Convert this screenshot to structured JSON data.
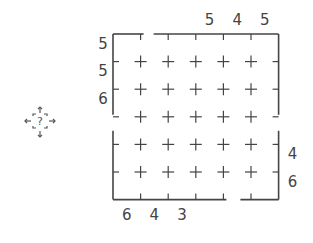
{
  "puzzle": {
    "grid": {
      "rows": 6,
      "cols": 6,
      "cell_size": 27.6,
      "origin_x": 113,
      "origin_y": 34,
      "line_color": "#444444"
    },
    "clues": {
      "top": [
        "",
        "",
        "",
        "5",
        "4",
        "5"
      ],
      "left": [
        "5",
        "5",
        "6",
        "",
        "",
        ""
      ],
      "right": [
        "",
        "",
        "",
        "",
        "4",
        "6"
      ],
      "bottom": [
        "6",
        "4",
        "3",
        "",
        "",
        ""
      ]
    },
    "openings": [
      {
        "side": "top",
        "between_cols": [
          1,
          2
        ]
      },
      {
        "side": "left",
        "row": 3
      },
      {
        "side": "right",
        "row": 3
      },
      {
        "side": "bottom",
        "between_cols": [
          4,
          5
        ]
      }
    ]
  },
  "help_button": {
    "icon": "question-move-icon",
    "label": "?"
  }
}
